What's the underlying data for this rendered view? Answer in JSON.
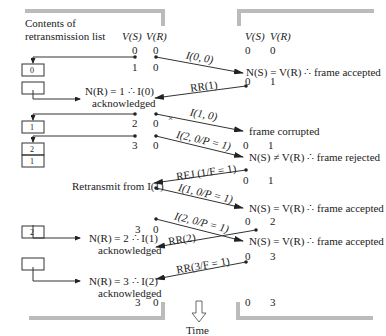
{
  "header": {
    "list_title_line1": "Contents of",
    "list_title_line2": "retransmission list",
    "vs_label": "V(S)",
    "vr_label": "V(R)"
  },
  "left_counters": [
    {
      "vs": "0",
      "vr": "0"
    },
    {
      "vs": "1",
      "vr": "0"
    },
    {
      "vs": "2",
      "vr": "0"
    },
    {
      "vs": "3",
      "vr": "0"
    },
    {
      "vs": "3",
      "vr": "0"
    },
    {
      "vs": "3",
      "vr": "0"
    }
  ],
  "right_counters": [
    {
      "vs": "0",
      "vr": "0"
    },
    {
      "vs": "0",
      "vr": "1"
    },
    {
      "vs": "0",
      "vr": "1"
    },
    {
      "vs": "0",
      "vr": "1"
    },
    {
      "vs": "0",
      "vr": "2"
    },
    {
      "vs": "0",
      "vr": "3"
    },
    {
      "vs": "0",
      "vr": "3"
    }
  ],
  "frames": [
    {
      "label": "I(0, 0)"
    },
    {
      "label": "RR(1)"
    },
    {
      "label": "I(1, 0)"
    },
    {
      "label": "I(2, 0/P = 1)"
    },
    {
      "label": "REJ (1/F = 1)"
    },
    {
      "label": "I(1, 0/P = 1)"
    },
    {
      "label": "I(2, 0/P = 1)"
    },
    {
      "label": "RR(2)"
    },
    {
      "label": "RR(3/F = 1)"
    }
  ],
  "receiver_notes": [
    "N(S) = V(R) ∴ frame accepted",
    "frame corrupted",
    "N(S) ≠ V(R) ∴ frame rejected",
    "N(S) = V(R) ∴ frame accepted",
    "N(S) = V(R) ∴ frame accepted"
  ],
  "sender_notes": [
    {
      "line1": "N(R) = 1 ∴ I(0)",
      "line2": "acknowledged"
    },
    {
      "line1": "Retransmit from I(1)",
      "line2": ""
    },
    {
      "line1": "N(R) = 2 ∴ I(1)",
      "line2": "acknowledged"
    },
    {
      "line1": "N(R) = 3 ∴ I(2)",
      "line2": "acknowledged"
    }
  ],
  "list_boxes": [
    [
      "0"
    ],
    [
      ""
    ],
    [
      "1"
    ],
    [
      "2",
      "1"
    ],
    [
      "2"
    ],
    [
      ""
    ]
  ],
  "time_label": "Time"
}
